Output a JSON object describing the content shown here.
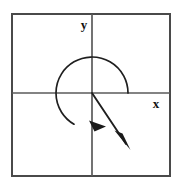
{
  "figure": {
    "background_color": "#ffffff",
    "stroke_color": "#3a3a3a",
    "curve_color": "#1a1a1a",
    "frame": {
      "x": 11,
      "y": 13,
      "width": 160,
      "height": 164,
      "stroke_width": 2
    },
    "axes": {
      "origin": {
        "x": 92,
        "y": 93
      },
      "x_axis": {
        "x1": 11,
        "y1": 93,
        "x2": 171,
        "y2": 93,
        "stroke_width": 1.6
      },
      "y_axis": {
        "x1": 92,
        "y1": 13,
        "x2": 92,
        "y2": 177,
        "stroke_width": 1.6
      },
      "labels": [
        {
          "name": "y-axis-label",
          "text": "y",
          "x": 84,
          "y": 29,
          "font_size": 13
        },
        {
          "name": "x-axis-label",
          "text": "x",
          "x": 156,
          "y": 108,
          "font_size": 13
        }
      ]
    },
    "circle": {
      "center": {
        "x": 92,
        "y": 93
      },
      "radius": 36,
      "stroke_width": 1.7,
      "arc_start_angle_deg": 0,
      "arc_end_angle_deg": 300,
      "arc_direction": "counterclockwise",
      "arc_path": "M 128 93 A 36 36 0 1 0 74 124.2",
      "arrow_at_end": true
    },
    "terminal_ray": {
      "from": {
        "x": 92,
        "y": 93
      },
      "to": {
        "x": 128,
        "y": 147
      },
      "angle_deg": -56,
      "stroke_width": 1.8,
      "arrow_at_end": true
    },
    "arrowheads": [
      {
        "name": "arc-arrowhead",
        "tip": {
          "x": 105,
          "y": 126
        },
        "points": "105,126 90,121 95,131.5",
        "fill": "#1a1a1a"
      },
      {
        "name": "ray-arrowhead",
        "tip": {
          "x": 129,
          "y": 149
        },
        "points": "129,149 116,131 123,134",
        "fill": "#1a1a1a"
      }
    ]
  }
}
